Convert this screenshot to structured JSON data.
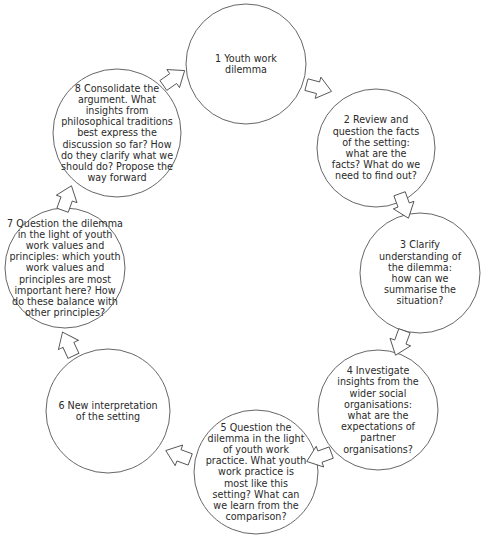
{
  "diagram": {
    "type": "cycle",
    "stroke_color": "#555555",
    "text_color": "#2a2a2a",
    "background": "#ffffff",
    "steps": [
      {
        "id": 1,
        "label": "1 Youth work dilemma",
        "cx": 246,
        "cy": 64,
        "r": 60,
        "text_width": 80
      },
      {
        "id": 2,
        "label": "2 Review and question the facts of the setting: what are the facts? What do we need to find out?",
        "cx": 376,
        "cy": 148,
        "r": 59,
        "text_width": 92
      },
      {
        "id": 3,
        "label": "3 Clarify understanding of the dilemma: how can we summarise the situation?",
        "cx": 420,
        "cy": 273,
        "r": 60,
        "text_width": 84
      },
      {
        "id": 4,
        "label": "4 Investigate insights from the wider social organisations: what are the expectations of partner organisations?",
        "cx": 378,
        "cy": 410,
        "r": 60,
        "text_width": 90
      },
      {
        "id": 5,
        "label": "5 Question the dilemma in the light of youth work practice. What youth work practice is most like this setting? What can we learn from the comparison?",
        "cx": 256,
        "cy": 472,
        "r": 62,
        "text_width": 102
      },
      {
        "id": 6,
        "label": "6 New interpretation of the setting",
        "cx": 108,
        "cy": 411,
        "r": 62,
        "text_width": 100
      },
      {
        "id": 7,
        "label": "7 Question the dilemma in the light of youth work values and principles: which youth work values and principles are most important here? How do these balance with other principles?",
        "cx": 65,
        "cy": 268,
        "r": 60,
        "text_width": 116
      },
      {
        "id": 8,
        "label": "8 Consolidate the argument. What insights from philosophical traditions best express the discussion so far? How do they clarify what we should do? Propose the way forward",
        "cx": 117,
        "cy": 133,
        "r": 64,
        "text_width": 118
      }
    ],
    "arrows": [
      {
        "from": 8,
        "to": 1,
        "x": 174,
        "y": 78,
        "angle": 55
      },
      {
        "from": 1,
        "to": 2,
        "x": 319,
        "y": 88,
        "angle": 105
      },
      {
        "from": 2,
        "to": 3,
        "x": 404,
        "y": 206,
        "angle": 160
      },
      {
        "from": 3,
        "to": 4,
        "x": 400,
        "y": 343,
        "angle": 200
      },
      {
        "from": 4,
        "to": 5,
        "x": 319,
        "y": 457,
        "angle": 250
      },
      {
        "from": 5,
        "to": 6,
        "x": 178,
        "y": 455,
        "angle": 290
      },
      {
        "from": 6,
        "to": 7,
        "x": 68,
        "y": 344,
        "angle": 335
      },
      {
        "from": 7,
        "to": 8,
        "x": 67,
        "y": 198,
        "angle": 20
      }
    ]
  }
}
